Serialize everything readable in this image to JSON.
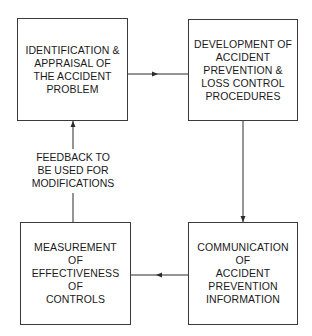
{
  "diagram": {
    "type": "cycle-flowchart",
    "nodes": [
      {
        "id": "identification",
        "lines": [
          "IDENTIFICATION &",
          "APPRAISAL OF",
          "THE ACCIDENT",
          "PROBLEM"
        ]
      },
      {
        "id": "development",
        "lines": [
          "DEVELOPMENT OF",
          "ACCIDENT",
          "PREVENTION &",
          "LOSS CONTROL",
          "PROCEDURES"
        ]
      },
      {
        "id": "communication",
        "lines": [
          "COMMUNICATION",
          "OF",
          "ACCIDENT",
          "PREVENTION",
          "INFORMATION"
        ]
      },
      {
        "id": "measurement",
        "lines": [
          "MEASUREMENT",
          "OF",
          "EFFECTIVENESS",
          "OF",
          "CONTROLS"
        ]
      }
    ],
    "edges": [
      {
        "from": "identification",
        "to": "development",
        "direction": "right"
      },
      {
        "from": "development",
        "to": "communication",
        "direction": "down"
      },
      {
        "from": "communication",
        "to": "measurement",
        "direction": "left"
      },
      {
        "from": "measurement",
        "to": "identification",
        "direction": "up",
        "label_lines": [
          "FEEDBACK TO",
          "BE USED FOR",
          "MODIFICATIONS"
        ]
      }
    ]
  },
  "colors": {
    "line": "#2a2a2a",
    "border": "#3a3a3a",
    "text": "#1a1a1a",
    "background": "#ffffff"
  }
}
